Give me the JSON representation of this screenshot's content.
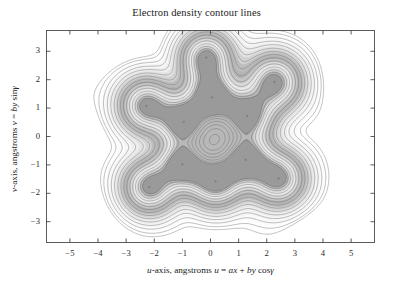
{
  "chart_data": {
    "type": "heatmap",
    "render": "contour",
    "title": "Electron density contour lines",
    "xlabel": "u-axis, angstroms u = ax + by cosγ",
    "xlabel_parts": {
      "var": "u",
      "text": "-axis, angstroms ",
      "eq_lhs": "u",
      "eq": " = ",
      "term1": "ax",
      "plus": " + ",
      "term2": "by",
      "trig": " cos",
      "gamma": "γ"
    },
    "ylabel": "v-axis, angstroms v = by sinγ",
    "ylabel_parts": {
      "var": "v",
      "text": "-axis, angstroms ",
      "eq_lhs": "v",
      "eq": " = ",
      "term2": "by",
      "trig": " sin",
      "gamma": "γ"
    },
    "xlim": [
      -5.85,
      5.85
    ],
    "ylim": [
      -3.75,
      3.75
    ],
    "xticks": [
      -5,
      -4,
      -3,
      -2,
      -1,
      0,
      1,
      2,
      3,
      4,
      5
    ],
    "xtick_labels": [
      "−5",
      "−4",
      "−3",
      "−2",
      "−1",
      "0",
      "1",
      "2",
      "3",
      "4",
      "5"
    ],
    "yticks": [
      -3,
      -2,
      -1,
      0,
      1,
      2,
      3
    ],
    "ytick_labels": [
      "−3",
      "−2",
      "−1",
      "0",
      "1",
      "2",
      "3"
    ],
    "grid": false,
    "legend": false,
    "frame": true,
    "contour_color": "#6b6b6b",
    "peak_core_color": "#8a8a8a",
    "peaks": [
      {
        "u": -0.15,
        "v": 2.78,
        "amp": 1.0,
        "sigma": 0.62
      },
      {
        "u": 2.28,
        "v": 1.92,
        "amp": 1.0,
        "sigma": 0.66
      },
      {
        "u": -2.28,
        "v": 1.08,
        "amp": 1.0,
        "sigma": 0.64
      },
      {
        "u": 0.05,
        "v": 1.38,
        "amp": 1.05,
        "sigma": 0.6
      },
      {
        "u": 1.3,
        "v": 0.72,
        "amp": 1.0,
        "sigma": 0.62
      },
      {
        "u": -0.95,
        "v": 0.52,
        "amp": 1.02,
        "sigma": 0.58
      },
      {
        "u": -1.0,
        "v": -0.98,
        "amp": 1.02,
        "sigma": 0.58
      },
      {
        "u": 1.25,
        "v": -0.82,
        "amp": 1.0,
        "sigma": 0.6
      },
      {
        "u": -2.18,
        "v": -1.78,
        "amp": 1.0,
        "sigma": 0.62
      },
      {
        "u": 0.18,
        "v": -1.58,
        "amp": 1.02,
        "sigma": 0.62
      },
      {
        "u": 2.42,
        "v": -1.48,
        "amp": 1.0,
        "sigma": 0.64
      }
    ],
    "peak_levels": [
      0.035,
      0.06,
      0.095,
      0.14,
      0.2,
      0.27,
      0.35,
      0.44,
      0.54,
      0.64,
      0.74,
      0.83,
      0.9,
      0.95
    ],
    "background_contour_level": 0.022,
    "noise_amplitude": 0.03
  },
  "axes_geometry": {
    "left": 46,
    "right": 375,
    "top": 30,
    "bottom": 243
  }
}
